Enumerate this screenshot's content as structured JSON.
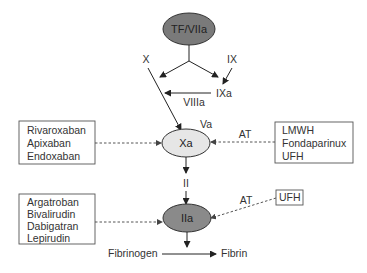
{
  "nodes": {
    "tf_viia": {
      "label": "TF/VIIa",
      "fill": "#7a7a7a"
    },
    "xa": {
      "label": "Xa",
      "fill": "#e6e6e6"
    },
    "iia": {
      "label": "IIa",
      "fill": "#8a8a8a"
    }
  },
  "factors": {
    "x": "X",
    "ix": "IX",
    "ixa": "IXa",
    "viiia": "VIIIa",
    "va": "Va",
    "ii": "II",
    "fibrinogen": "Fibrinogen",
    "fibrin": "Fibrin"
  },
  "cofactor_labels": {
    "at_xa": "AT",
    "at_iia": "AT"
  },
  "boxes": {
    "xa_direct": [
      "Rivaroxaban",
      "Apixaban",
      "Endoxaban"
    ],
    "xa_indirect": [
      "LMWH",
      "Fondaparinux",
      "UFH"
    ],
    "iia_direct": [
      "Argatroban",
      "Bivalirudin",
      "Dabigatran",
      "Lepirudin"
    ],
    "iia_indirect": [
      "UFH"
    ]
  }
}
